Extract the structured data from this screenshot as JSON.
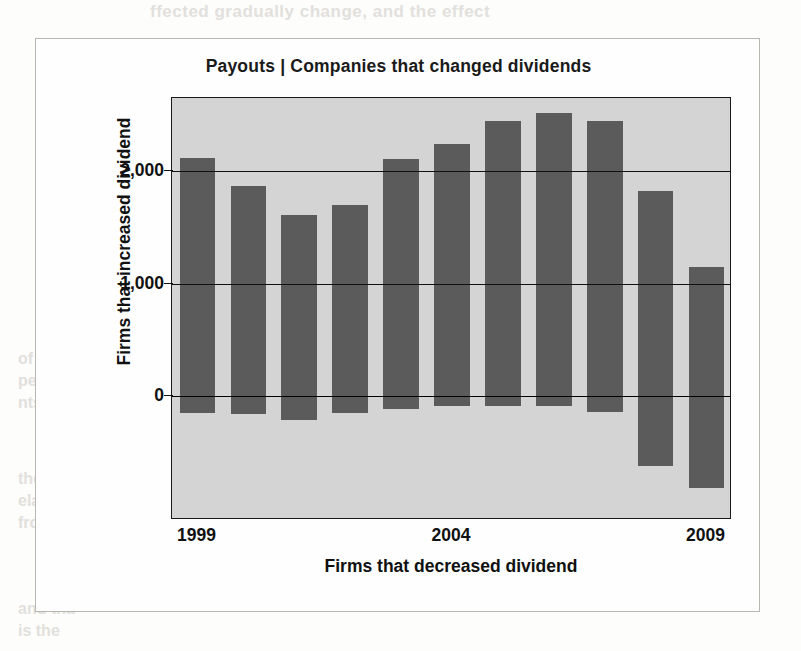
{
  "figure": {
    "title": "Payouts | Companies that changed dividends",
    "background_color": "#d4d4d4",
    "bar_color": "#5b5b5b",
    "frame_color": "#b9b7b2"
  },
  "chart_data": {
    "type": "bar",
    "title": "Payouts | Companies that changed dividends",
    "xlabel": "Firms that decreased dividend",
    "ylabel": "Firms that increased dividend",
    "grid": true,
    "legend": "none",
    "ylim": [
      -1100,
      2650
    ],
    "yticks": [
      0,
      1000,
      2000
    ],
    "ytick_labels": [
      "0",
      "1,000",
      "2,000"
    ],
    "categories": [
      1999,
      2000,
      2001,
      2002,
      2003,
      2004,
      2005,
      2006,
      2007,
      2008,
      2009
    ],
    "xtick_labels": [
      "1999",
      "2004",
      "2009"
    ],
    "xtick_categories": [
      1999,
      2004,
      2009
    ],
    "series": [
      {
        "name": "Firms that increased dividend",
        "values": [
          2120,
          1870,
          1610,
          1700,
          2110,
          2240,
          2450,
          2520,
          2450,
          1820,
          1150
        ]
      },
      {
        "name": "Firms that decreased dividend",
        "values": [
          -150,
          -155,
          -215,
          -150,
          -115,
          -90,
          -85,
          -90,
          -140,
          -620,
          -820
        ]
      }
    ]
  },
  "bleed_text": {
    "line1": "ffected gradually change, and the effect",
    "line2": "inconsi",
    "line3": "of portfol",
    "line4": "percentage",
    "line5": "nts.",
    "line6": "the compen",
    "line7": "elatively",
    "line8": "from th",
    "line9": "and tha",
    "line10": "is the"
  }
}
